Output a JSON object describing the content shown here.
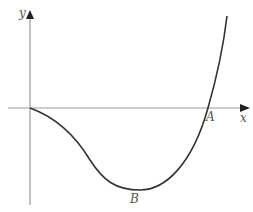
{
  "figure": {
    "axes": {
      "x_label": "x",
      "y_label": "y",
      "axis_color": "#999999"
    },
    "curve": {
      "color": "#333333",
      "points_of_interest": [
        {
          "name": "A",
          "label": "A",
          "description": "x-intercept"
        },
        {
          "name": "B",
          "label": "B",
          "description": "minimum point"
        }
      ]
    }
  }
}
